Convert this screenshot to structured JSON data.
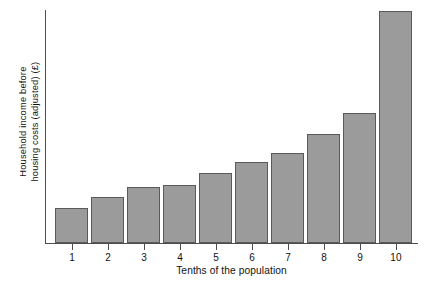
{
  "chart_data": {
    "type": "bar",
    "title": "",
    "xlabel": "Tenths of the population",
    "ylabel": "Household income before housing costs (adjusted) (£)",
    "ylabel_line1": "Household income before",
    "ylabel_line2": "housing costs (adjusted) (£)",
    "categories": [
      "1",
      "2",
      "3",
      "4",
      "5",
      "6",
      "7",
      "8",
      "9",
      "10"
    ],
    "values": [
      15,
      20,
      24,
      25,
      30,
      35,
      39,
      47,
      56,
      100
    ],
    "value_unit": "relative height (% of tallest bar)",
    "ylim": [
      0,
      100
    ],
    "yticks": [],
    "ytick_labels": [],
    "grid": false,
    "legend": null,
    "series": [
      {
        "name": "Household income before housing costs (adjusted)",
        "values": [
          15,
          20,
          24,
          25,
          30,
          35,
          39,
          47,
          56,
          100
        ]
      }
    ],
    "bar_color": "#9b9b9b",
    "bar_edge_color": "#5a5a5a",
    "axis_color": "#4d4d4d",
    "background_color": "#ffffff"
  },
  "axes": {
    "x_tick_labels": [
      "1",
      "2",
      "3",
      "4",
      "5",
      "6",
      "7",
      "8",
      "9",
      "10"
    ],
    "x_title": "Tenths of the population",
    "y_title_line1": "Household income before",
    "y_title_line2": "housing costs (adjusted) (£)"
  }
}
